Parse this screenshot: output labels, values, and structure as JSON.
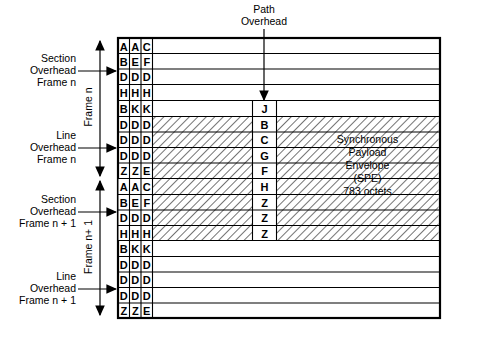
{
  "labels": {
    "path_overhead": "Path\nOverhead",
    "section_overhead_n": "Section\nOverhead\nFrame n",
    "line_overhead_n": "Line\nOverhead\nFrame n",
    "section_overhead_n1": "Section\nOverhead\nFrame n + 1",
    "line_overhead_n1": "Line\nOverhead\nFrame n + 1",
    "frame_n": "Frame n",
    "frame_n1": "Frame n+ 1",
    "spe": "Synchronous\nPayload\nEnvelope\n(SPE)\n783 octets"
  },
  "grid": {
    "rows": [
      {
        "cells": [
          "A",
          "A",
          "C"
        ],
        "hatched": false,
        "poh": "",
        "poh_present": false
      },
      {
        "cells": [
          "B",
          "E",
          "F"
        ],
        "hatched": false,
        "poh": "",
        "poh_present": false
      },
      {
        "cells": [
          "D",
          "D",
          "D"
        ],
        "hatched": false,
        "poh": "",
        "poh_present": false
      },
      {
        "cells": [
          "H",
          "H",
          "H"
        ],
        "hatched": false,
        "poh": "",
        "poh_present": false
      },
      {
        "cells": [
          "B",
          "K",
          "K"
        ],
        "hatched": false,
        "poh": "J",
        "poh_present": true
      },
      {
        "cells": [
          "D",
          "D",
          "D"
        ],
        "hatched": true,
        "poh": "B",
        "poh_present": true
      },
      {
        "cells": [
          "D",
          "D",
          "D"
        ],
        "hatched": true,
        "poh": "C",
        "poh_present": true
      },
      {
        "cells": [
          "D",
          "D",
          "D"
        ],
        "hatched": true,
        "poh": "G",
        "poh_present": true
      },
      {
        "cells": [
          "Z",
          "Z",
          "E"
        ],
        "hatched": true,
        "poh": "F",
        "poh_present": true
      },
      {
        "cells": [
          "A",
          "A",
          "C"
        ],
        "hatched": true,
        "poh": "H",
        "poh_present": true
      },
      {
        "cells": [
          "B",
          "E",
          "F"
        ],
        "hatched": true,
        "poh": "Z",
        "poh_present": true
      },
      {
        "cells": [
          "D",
          "D",
          "D"
        ],
        "hatched": true,
        "poh": "Z",
        "poh_present": true
      },
      {
        "cells": [
          "H",
          "H",
          "H"
        ],
        "hatched": true,
        "poh": "Z",
        "poh_present": true
      },
      {
        "cells": [
          "B",
          "K",
          "K"
        ],
        "hatched": false,
        "poh": "",
        "poh_present": false
      },
      {
        "cells": [
          "D",
          "D",
          "D"
        ],
        "hatched": false,
        "poh": "",
        "poh_present": false
      },
      {
        "cells": [
          "D",
          "D",
          "D"
        ],
        "hatched": false,
        "poh": "",
        "poh_present": false
      },
      {
        "cells": [
          "D",
          "D",
          "D"
        ],
        "hatched": false,
        "poh": "",
        "poh_present": false
      },
      {
        "cells": [
          "Z",
          "Z",
          "E"
        ],
        "hatched": false,
        "poh": "",
        "poh_present": false
      }
    ]
  },
  "colors": {
    "line": "#000000",
    "background": "#ffffff",
    "hatch": "#000000"
  }
}
